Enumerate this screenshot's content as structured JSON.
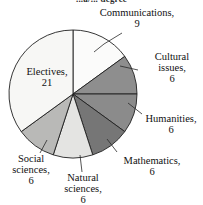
{
  "chart_data": {
    "type": "pie",
    "title": "...a/... degree",
    "title_note": "partially cut off at top of image",
    "total": 54,
    "unit_label": "",
    "categories": [
      "Communications",
      "Cultural issues",
      "Humanities",
      "Mathematics",
      "Natural sciences",
      "Social sciences",
      "Electives"
    ],
    "values": [
      9,
      6,
      6,
      6,
      6,
      6,
      21
    ],
    "slices": [
      {
        "label": "Communications",
        "value": 9,
        "color": "#fbfbfa",
        "start_deg": 0,
        "end_deg": 60,
        "label_text": "Communications,",
        "value_text": "9"
      },
      {
        "label": "Cultural issues",
        "value": 6,
        "color": "#8e8e8e",
        "start_deg": 60,
        "end_deg": 100,
        "label_text": "Cultural issues,",
        "value_text": "6"
      },
      {
        "label": "Humanities",
        "value": 6,
        "color": "#8b8b8b",
        "start_deg": 100,
        "end_deg": 140,
        "label_text": "Humanities,",
        "value_text": "6"
      },
      {
        "label": "Mathematics",
        "value": 6,
        "color": "#767676",
        "start_deg": 140,
        "end_deg": 180,
        "label_text": "Mathematics,",
        "value_text": "6"
      },
      {
        "label": "Natural sciences",
        "value": 6,
        "color": "#e4e4e2",
        "start_deg": 180,
        "end_deg": 220,
        "label_text": "Natural sciences,",
        "value_text": "6"
      },
      {
        "label": "Social sciences",
        "value": 6,
        "color": "#b9b9b7",
        "start_deg": 220,
        "end_deg": 260,
        "label_text": "Social sciences,",
        "value_text": "6"
      },
      {
        "label": "Electives",
        "value": 21,
        "color": "#f7f7f5",
        "start_deg": 260,
        "end_deg": 400,
        "label_text": "Electives,",
        "value_text": "21"
      }
    ],
    "legend": "none",
    "grid": false,
    "xlabel": "",
    "ylabel": ""
  },
  "labels": {
    "communications": {
      "name": "Communications,",
      "value": "9"
    },
    "cultural_issues": {
      "name_line1": "Cultural",
      "name_line2": "issues,",
      "value": "6"
    },
    "humanities": {
      "name": "Humanities,",
      "value": "6"
    },
    "mathematics": {
      "name": "Mathematics,",
      "value": "6"
    },
    "natural_sciences": {
      "name_line1": "Natural",
      "name_line2": "sciences,",
      "value": "6"
    },
    "social_sciences": {
      "name_line1": "Social",
      "name_line2": "sciences,",
      "value": "6"
    },
    "electives": {
      "name": "Electives,",
      "value": "21"
    }
  },
  "title": {
    "text": "...a/... degree"
  },
  "geometry": {
    "center_x": 73,
    "center_y": 94,
    "radius": 64
  }
}
